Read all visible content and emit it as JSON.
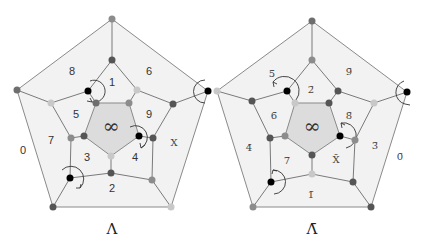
{
  "colors": {
    "vertex_dark": "#555555",
    "vertex_mid": "#8c8c8c",
    "vertex_light": "#c8c8c8",
    "vertex_black": "#000000",
    "face_fill": "#f2f2f2",
    "center_fill": "#dcdcdc",
    "edge": "#7a7a7a"
  },
  "left_diagram": {
    "caption": "Λ",
    "center_label": "∞",
    "face_labels": {
      "outer": "0",
      "f1": "1",
      "f2": "2",
      "f3": "3",
      "f4": "4",
      "f5": "5",
      "f6": "6",
      "f7": "7",
      "f8": "8",
      "f9": "9",
      "fX": "X"
    }
  },
  "right_diagram": {
    "caption": "Λ̄",
    "center_label": "∞",
    "face_labels": {
      "outer": "0̄",
      "f1": "1̄",
      "f2": "2̄",
      "f3": "3̄",
      "f4": "4̄",
      "f5": "5̄",
      "f6": "6̄",
      "f7": "7̄",
      "f8": "8̄",
      "f9": "9̄",
      "fX": "X̄"
    }
  }
}
